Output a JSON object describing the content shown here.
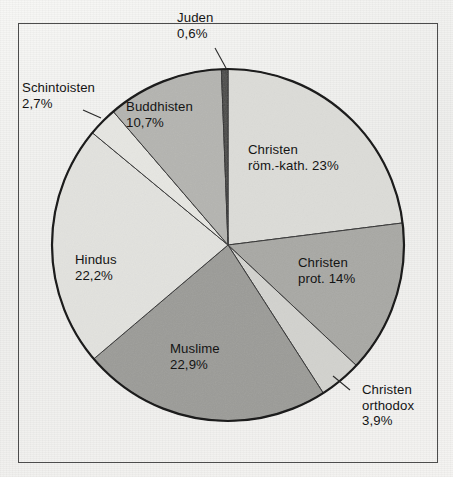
{
  "figure": {
    "title": "",
    "frame": {
      "border_color": "#4c4c4c"
    },
    "background_color": "#f2f2f0"
  },
  "chart_data": {
    "type": "pie",
    "title": "",
    "xlabel": "",
    "ylabel": "",
    "units": "percent",
    "start_angle_deg": 0,
    "direction": "clockwise",
    "center": {
      "x": 228,
      "y": 245
    },
    "radius": 176,
    "legend": "none",
    "grid": false,
    "labels": [
      "Christen röm.-kath.",
      "Christen prot.",
      "Christen orthodox",
      "Muslime",
      "Hindus",
      "Schintoisten",
      "Buddhisten",
      "Juden"
    ],
    "values": [
      23,
      14,
      3.9,
      22.9,
      22.2,
      2.7,
      10.7,
      0.6
    ],
    "value_texts": [
      "23%",
      "14%",
      "3,9%",
      "22,9%",
      "22,2%",
      "2,7%",
      "10,7%",
      "0,6%"
    ],
    "colors": [
      "#dcdcd8",
      "#a8a8a4",
      "#d2d2ce",
      "#9b9b97",
      "#e2e2de",
      "#e6e6e2",
      "#b4b4b0",
      "#4a4a48"
    ],
    "slices": [
      {
        "name": "Christen röm.-kath.",
        "value": 23,
        "value_text": "23%",
        "color": "#dcdcd8",
        "label_placement": "inside"
      },
      {
        "name": "Christen prot.",
        "value": 14,
        "value_text": "14%",
        "color": "#a8a8a4",
        "label_placement": "inside"
      },
      {
        "name": "Christen orthodox",
        "value": 3.9,
        "value_text": "3,9%",
        "color": "#d2d2ce",
        "label_placement": "outside"
      },
      {
        "name": "Muslime",
        "value": 22.9,
        "value_text": "22,9%",
        "color": "#9b9b97",
        "label_placement": "inside"
      },
      {
        "name": "Hindus",
        "value": 22.2,
        "value_text": "22,2%",
        "color": "#e2e2de",
        "label_placement": "inside"
      },
      {
        "name": "Schintoisten",
        "value": 2.7,
        "value_text": "2,7%",
        "color": "#e6e6e2",
        "label_placement": "outside"
      },
      {
        "name": "Buddhisten",
        "value": 10.7,
        "value_text": "10,7%",
        "color": "#b4b4b0",
        "label_placement": "inside"
      },
      {
        "name": "Juden",
        "value": 0.6,
        "value_text": "0,6%",
        "color": "#4a4a48",
        "label_placement": "outside"
      }
    ]
  },
  "labels": {
    "juden": {
      "line1": "Juden",
      "line2": "0,6%",
      "line3": ""
    },
    "schintoisten": {
      "line1": "Schintoisten",
      "line2": "2,7%",
      "line3": ""
    },
    "buddhisten": {
      "line1": "Buddhisten",
      "line2": "10,7%",
      "line3": ""
    },
    "roem_kath": {
      "line1": "Christen",
      "line2": "röm.-kath. 23%",
      "line3": ""
    },
    "prot": {
      "line1": "Christen",
      "line2": "prot. 14%",
      "line3": ""
    },
    "orthodox": {
      "line1": "Christen",
      "line2": "orthodox",
      "line3": "3,9%"
    },
    "muslime": {
      "line1": "Muslime",
      "line2": "22,9%",
      "line3": ""
    },
    "hindus": {
      "line1": "Hindus",
      "line2": "22,2%",
      "line3": ""
    }
  }
}
